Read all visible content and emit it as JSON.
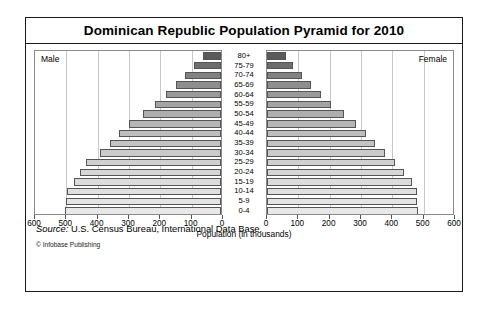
{
  "chart_title": "Dominican Republic Population Pyramid for 2010",
  "panel": {
    "male_label": "Male",
    "female_label": "Female"
  },
  "axis": {
    "xlabel": "Population (in thousands)",
    "male_ticks": [
      "600",
      "500",
      "400",
      "300",
      "200",
      "100",
      "0"
    ],
    "female_ticks": [
      "0",
      "100",
      "200",
      "300",
      "400",
      "500",
      "600"
    ],
    "max": 600,
    "tick_step": 100,
    "grid": true
  },
  "footer": {
    "source_word": "Source:",
    "source_text": " U.S. Census Bureau, International Data Base.",
    "copyright": "© Infobase Publishing"
  },
  "chart_data": {
    "type": "bar",
    "subtype": "population-pyramid",
    "title": "Dominican Republic Population Pyramid for 2010",
    "xlabel": "Population (in thousands)",
    "ylabel": "",
    "xlim": [
      0,
      600
    ],
    "grid": true,
    "legend": [
      "Male",
      "Female"
    ],
    "legend_position": "inside-top-corners",
    "categories": [
      "0-4",
      "5-9",
      "10-14",
      "15-19",
      "20-24",
      "25-29",
      "30-34",
      "35-39",
      "40-44",
      "45-49",
      "50-54",
      "55-59",
      "60-64",
      "65-69",
      "70-74",
      "75-79",
      "80+"
    ],
    "series": [
      {
        "name": "Male",
        "direction": "left",
        "values": [
          498,
          495,
          492,
          470,
          450,
          430,
          385,
          355,
          325,
          295,
          250,
          210,
          175,
          145,
          115,
          85,
          58
        ]
      },
      {
        "name": "Female",
        "direction": "right",
        "values": [
          482,
          480,
          478,
          462,
          438,
          410,
          375,
          345,
          315,
          285,
          245,
          205,
          172,
          142,
          112,
          82,
          60
        ]
      }
    ],
    "bar_shades": [
      "#e8e8e8",
      "#e4e4e4",
      "#e0e0e0",
      "#dcdcdc",
      "#d6d6d6",
      "#d0d0d0",
      "#cacaca",
      "#c4c4c4",
      "#bebebe",
      "#b6b6b6",
      "#aeaeae",
      "#a4a4a4",
      "#9a9a9a",
      "#8e8e8e",
      "#828282",
      "#6e6e6e",
      "#5a5a5a"
    ]
  }
}
